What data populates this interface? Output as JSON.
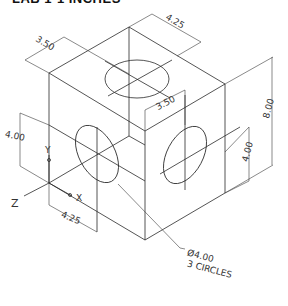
{
  "title": "LAB 1-1 INCHES",
  "dimensions": {
    "top_depth": "3.50",
    "top_width": "4.25",
    "front_inner": "3.50",
    "height_total": "8.00",
    "right_hole_height": "4.00",
    "left_hole_height": "4.00",
    "bottom_width": "4.25"
  },
  "axes": {
    "x": "X",
    "y": "Y",
    "z": "Z"
  },
  "callout": {
    "line1": "Ø4.00",
    "line2": "3 CIRCLES"
  },
  "colors": {
    "line": "#2a2a2a",
    "background": "#ffffff"
  }
}
